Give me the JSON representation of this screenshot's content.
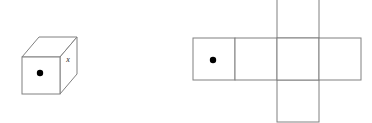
{
  "figure": {
    "background_color": "#ffffff",
    "line_color": "#808080",
    "dot_color": "#000000",
    "label_color": "#1a1a1a"
  },
  "cube": {
    "name": "isometric-cube",
    "front_face": {
      "label": "",
      "marker": "dot",
      "marker_x": 40,
      "marker_y": 73,
      "marker_radius": 3.2
    },
    "right_face": {
      "label": "x",
      "label_x": 68,
      "label_y": 62
    },
    "top_face": {
      "label": ""
    },
    "geometry": {
      "front_left": 22,
      "front_top": 57,
      "front_right": 60,
      "front_bottom": 94,
      "depth_dx": 17,
      "depth_dy": -20
    }
  },
  "net": {
    "name": "cube-net-cross",
    "cell_size": 42,
    "strip_top": 38,
    "strip_left": 193,
    "strip_cells": 4,
    "vertical_column_index": 2,
    "squares": [
      {
        "id": "net-square-1",
        "x": 193,
        "y": 38,
        "label": "",
        "marker": "dot",
        "marker_x": 213,
        "marker_y": 60,
        "marker_radius": 3.2
      },
      {
        "id": "net-square-2",
        "x": 235,
        "y": 38,
        "label": "",
        "marker": "none"
      },
      {
        "id": "net-square-3",
        "x": 277,
        "y": 38,
        "label": "",
        "marker": "none"
      },
      {
        "id": "net-square-4",
        "x": 319,
        "y": 38,
        "label": "",
        "marker": "none"
      },
      {
        "id": "net-square-top",
        "x": 277,
        "y": -4,
        "label": "",
        "marker": "none"
      },
      {
        "id": "net-square-bottom",
        "x": 277,
        "y": 80,
        "label": "",
        "marker": "none"
      }
    ]
  }
}
